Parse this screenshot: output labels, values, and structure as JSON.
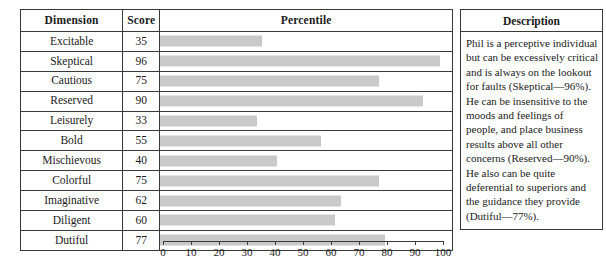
{
  "table": {
    "headers": {
      "dimension": "Dimension",
      "score": "Score",
      "percentile": "Percentile"
    },
    "rows": [
      {
        "dimension": "Excitable",
        "score": "35",
        "value": 35
      },
      {
        "dimension": "Skeptical",
        "score": "96",
        "value": 96
      },
      {
        "dimension": "Cautious",
        "score": "75",
        "value": 75
      },
      {
        "dimension": "Reserved",
        "score": "90",
        "value": 90
      },
      {
        "dimension": "Leisurely",
        "score": "33",
        "value": 33
      },
      {
        "dimension": "Bold",
        "score": "55",
        "value": 55
      },
      {
        "dimension": "Mischievous",
        "score": "40",
        "value": 40
      },
      {
        "dimension": "Colorful",
        "score": "75",
        "value": 75
      },
      {
        "dimension": "Imaginative",
        "score": "62",
        "value": 62
      },
      {
        "dimension": "Diligent",
        "score": "60",
        "value": 60
      },
      {
        "dimension": "Dutiful",
        "score": "77",
        "value": 77
      }
    ]
  },
  "axis": {
    "min": 0,
    "max": 100,
    "step": 10,
    "ticks": [
      "0",
      "10",
      "20",
      "30",
      "40",
      "50",
      "60",
      "70",
      "80",
      "90",
      "100"
    ]
  },
  "description": {
    "header": "Description",
    "paragraphs": [
      "Phil is a perceptive individual but can be excessively critical and is always on the lookout for faults (Skeptical—96%).",
      "He can be insensitive to the moods and feelings of people, and place business results above all other concerns (Reserved—90%).",
      "He also can be quite deferential to superiors and the guidance they provide (Dutiful—77%)."
    ]
  },
  "colors": {
    "bar_fill": "#c9c9c9",
    "border": "#3a3a3a",
    "text": "#1a1a1a",
    "background": "#ffffff"
  },
  "chart_data": {
    "type": "bar",
    "title": "Percentile",
    "xlabel": "",
    "ylabel": "Dimension",
    "categories": [
      "Excitable",
      "Skeptical",
      "Cautious",
      "Reserved",
      "Leisurely",
      "Bold",
      "Mischievous",
      "Colorful",
      "Imaginative",
      "Diligent",
      "Dutiful"
    ],
    "values": [
      35,
      96,
      75,
      90,
      33,
      55,
      40,
      75,
      62,
      60,
      77
    ],
    "xlim": [
      0,
      100
    ],
    "grid": false,
    "legend": false,
    "orientation": "horizontal"
  }
}
